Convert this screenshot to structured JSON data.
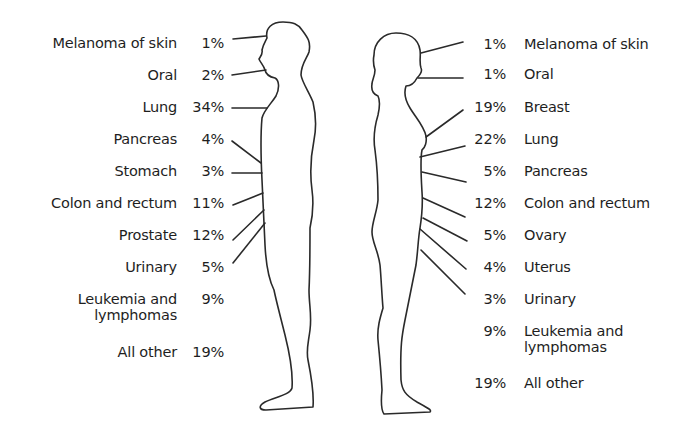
{
  "figure": {
    "type": "cancer-incidence-by-site-and-sex",
    "male": {
      "items": [
        {
          "label": "Melanoma of skin",
          "percent": "1%"
        },
        {
          "label": "Oral",
          "percent": "2%"
        },
        {
          "label": "Lung",
          "percent": "34%"
        },
        {
          "label": "Pancreas",
          "percent": "4%"
        },
        {
          "label": "Stomach",
          "percent": "3%"
        },
        {
          "label": "Colon and rectum",
          "percent": "11%"
        },
        {
          "label": "Prostate",
          "percent": "12%"
        },
        {
          "label": "Urinary",
          "percent": "5%"
        },
        {
          "label_line1": "Leukemia and",
          "label_line2": "lymphomas",
          "percent": "9%"
        },
        {
          "label": "All other",
          "percent": "19%"
        }
      ]
    },
    "female": {
      "items": [
        {
          "label": "Melanoma of skin",
          "percent": "1%"
        },
        {
          "label": "Oral",
          "percent": "1%"
        },
        {
          "label": "Breast",
          "percent": "19%"
        },
        {
          "label": "Lung",
          "percent": "22%"
        },
        {
          "label": "Pancreas",
          "percent": "5%"
        },
        {
          "label": "Colon and rectum",
          "percent": "12%"
        },
        {
          "label": "Ovary",
          "percent": "5%"
        },
        {
          "label": "Uterus",
          "percent": "4%"
        },
        {
          "label": "Urinary",
          "percent": "3%"
        },
        {
          "label_line1": "Leukemia and",
          "label_line2": "lymphomas",
          "percent": "9%"
        },
        {
          "label": "All other",
          "percent": "19%"
        }
      ]
    }
  }
}
